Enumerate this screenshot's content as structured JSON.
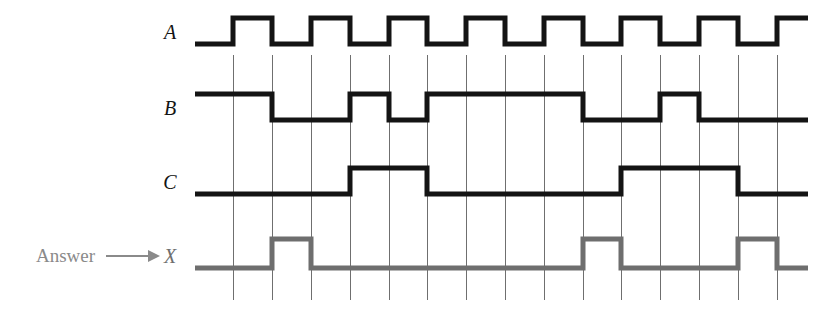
{
  "figure": {
    "type": "digital-timing-diagram",
    "title": "",
    "background_color": "#ffffff",
    "width": 836,
    "height": 317
  },
  "annotation": {
    "answer_text": "Answer",
    "arrow_glyph": "arrow-right",
    "color": "#8a8a8a"
  },
  "axis": {
    "t_start_px": 195,
    "t_end_px": 808,
    "grid_top_px": 55,
    "grid_bottom_px": 300,
    "grid_color": "#6f6f6f",
    "grid_x_positions": [
      233,
      272,
      311,
      350,
      389,
      427,
      466,
      505,
      544,
      583,
      621,
      660,
      699,
      738,
      777
    ],
    "tick_count": 15,
    "tick_spacing_px": 38.8
  },
  "signals": [
    {
      "name": "A",
      "label": "A",
      "color": "#141414",
      "stroke_width": 5,
      "y_high": 18,
      "y_low": 44,
      "label_x": 170,
      "label_y": 39,
      "initial_level": 0,
      "transitions": [
        233,
        272,
        311,
        350,
        389,
        427,
        466,
        505,
        544,
        583,
        621,
        660,
        699,
        738,
        777
      ],
      "description": "clock; toggles at every grid line, starts low, ends high"
    },
    {
      "name": "B",
      "label": "B",
      "color": "#141414",
      "stroke_width": 5,
      "y_high": 94,
      "y_low": 120,
      "label_x": 170,
      "label_y": 115,
      "initial_level": 1,
      "transitions": [
        272,
        350,
        389,
        427,
        583,
        660,
        699
      ],
      "description": "high, low, high, low, high (long), low, short pulse high, low to end"
    },
    {
      "name": "C",
      "label": "C",
      "color": "#141414",
      "stroke_width": 5,
      "y_high": 168,
      "y_low": 194,
      "label_x": 170,
      "label_y": 189,
      "initial_level": 0,
      "transitions": [
        350,
        427,
        621,
        738
      ],
      "description": "low, high (2 cells), low (5 cells), high (3 cells), low to end"
    },
    {
      "name": "X",
      "label": "X",
      "color": "#6e6e6e",
      "stroke_width": 5,
      "y_high": 239,
      "y_low": 268,
      "label_x": 170,
      "label_y": 263,
      "initial_level": 0,
      "transitions": [
        272,
        311,
        583,
        621,
        738,
        777
      ],
      "description": "answer output; three narrow high pulses, one grid cell wide each"
    }
  ],
  "chart_data": {
    "type": "line",
    "xlabel": "time",
    "ylabel": "logic level",
    "x": [
      195,
      233,
      272,
      311,
      350,
      389,
      427,
      466,
      505,
      544,
      583,
      621,
      660,
      699,
      738,
      777,
      808
    ],
    "series": [
      {
        "name": "A",
        "values": [
          0,
          1,
          0,
          1,
          0,
          1,
          0,
          1,
          0,
          1,
          0,
          1,
          0,
          1,
          0,
          1,
          1
        ]
      },
      {
        "name": "B",
        "values": [
          1,
          1,
          0,
          0,
          1,
          1,
          0,
          0,
          0,
          0,
          0,
          1,
          0,
          0,
          0,
          0,
          0
        ]
      },
      {
        "name": "C",
        "values": [
          0,
          0,
          0,
          0,
          1,
          1,
          0,
          0,
          0,
          0,
          0,
          1,
          1,
          1,
          0,
          0,
          0
        ]
      },
      {
        "name": "X",
        "values": [
          0,
          0,
          1,
          0,
          0,
          0,
          0,
          0,
          0,
          0,
          1,
          0,
          0,
          0,
          1,
          0,
          0
        ]
      }
    ],
    "legend_position": "left-labels",
    "grid": true,
    "ylim": [
      0,
      1
    ]
  }
}
